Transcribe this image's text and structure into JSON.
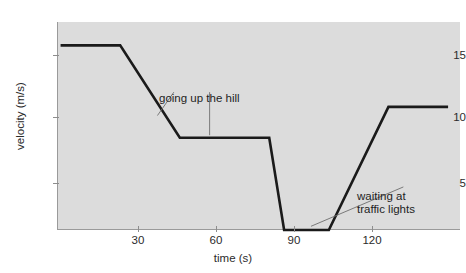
{
  "chart_data": {
    "type": "line",
    "title": "",
    "xlabel": "time (s)",
    "ylabel": "velocity (m/s)",
    "xlim": [
      -1.2,
      134
    ],
    "ylim": [
      0,
      16.9
    ],
    "xticks": [
      30,
      60,
      90,
      120
    ],
    "xtick_labels": [
      "30",
      "60",
      "90",
      "120"
    ],
    "yticks": [
      5,
      10,
      15
    ],
    "ytick_labels": [
      "5",
      "10",
      "15"
    ],
    "grid": false,
    "legend": "none",
    "plot_background": "#dcdcdc",
    "line_color": "#1a1a1a",
    "axis_color": "#9a9a9a",
    "series": [
      {
        "name": "velocity",
        "x": [
          0,
          20,
          40,
          70,
          75,
          90,
          110,
          130
        ],
        "values": [
          15,
          15,
          7.5,
          7.5,
          0,
          0,
          10,
          10
        ]
      }
    ],
    "annotations": [
      {
        "id": "going-up-the-hill",
        "text": "going up the hill",
        "text_x": 39,
        "text_y": 12.0,
        "leaders": [
          {
            "from_x": 38,
            "from_y": 11.2,
            "to_x": 32.5,
            "to_y": 9.3
          },
          {
            "from_x": 50,
            "from_y": 11.2,
            "to_x": 50,
            "to_y": 7.7
          }
        ]
      },
      {
        "id": "waiting-at-traffic-lights",
        "text_line1": "waiting at",
        "text_line2": "traffic lights",
        "text_x": 116,
        "text_y": 4.1,
        "leaders": [
          {
            "from_x": 115,
            "from_y": 3.5,
            "to_x": 84,
            "to_y": 0.3
          }
        ]
      }
    ]
  },
  "axis": {
    "y_label": "velocity (m/s)",
    "x_label": "time (s)",
    "y_ticks": [
      "15",
      "10",
      "5"
    ],
    "x_ticks": [
      "30",
      "60",
      "90",
      "120"
    ]
  },
  "annotations": {
    "hill": "going up the hill",
    "wait_line1": "waiting at",
    "wait_line2": "traffic lights"
  }
}
